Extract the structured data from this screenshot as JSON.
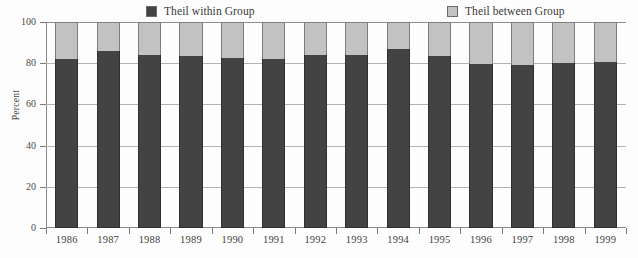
{
  "chart_data": {
    "type": "bar",
    "subtype": "stacked-percentage",
    "title": "",
    "xlabel": "",
    "ylabel": "Percent",
    "ylim": [
      0,
      100
    ],
    "yticks": [
      0,
      20,
      40,
      60,
      80,
      100
    ],
    "grid": true,
    "legend_position": "top",
    "categories": [
      "1986",
      "1987",
      "1988",
      "1989",
      "1990",
      "1991",
      "1992",
      "1993",
      "1994",
      "1995",
      "1996",
      "1997",
      "1998",
      "1999"
    ],
    "series": [
      {
        "name": "Theil within Group",
        "color": "#434343",
        "values": [
          82,
          86,
          84,
          83.5,
          82.5,
          82,
          84,
          84,
          87,
          83.5,
          79.5,
          79,
          80,
          80.5
        ]
      },
      {
        "name": "Theil between Group",
        "color": "#c2c2c2",
        "values": [
          18,
          14,
          16,
          16.5,
          17.5,
          18,
          16,
          16,
          13,
          16.5,
          20.5,
          21,
          20,
          19.5
        ]
      }
    ]
  },
  "legend": {
    "entries": [
      {
        "label": "Theil within Group",
        "swatch": "#434343"
      },
      {
        "label": "Theil between Group",
        "swatch": "#c2c2c2"
      }
    ]
  },
  "axes": {
    "y": {
      "label": "Percent",
      "ticks": [
        "0",
        "20",
        "40",
        "60",
        "80",
        "100"
      ]
    },
    "x": {
      "ticks": [
        "1986",
        "1987",
        "1988",
        "1989",
        "1990",
        "1991",
        "1992",
        "1993",
        "1994",
        "1995",
        "1996",
        "1997",
        "1998",
        "1999"
      ]
    }
  }
}
